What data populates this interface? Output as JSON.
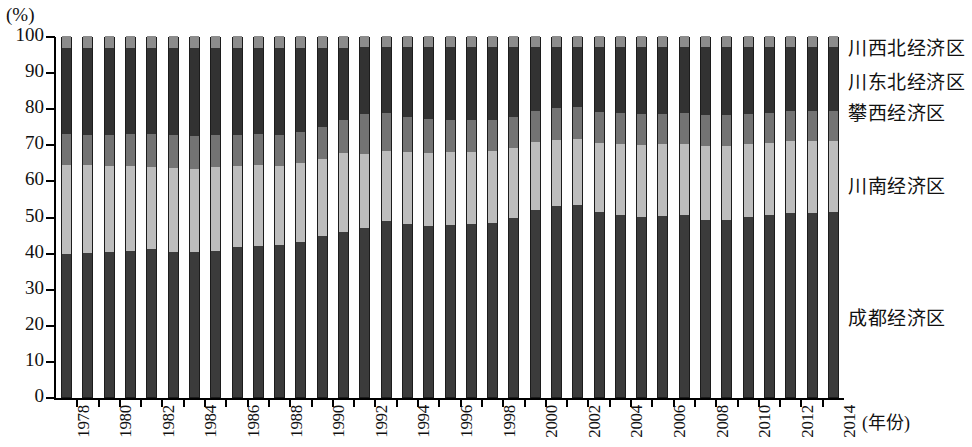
{
  "chart_data": {
    "type": "bar",
    "stacked": true,
    "title": "",
    "subtitle": "",
    "xlabel": "(年份)",
    "ylabel": "(%)",
    "ylim": [
      0,
      100
    ],
    "grid": false,
    "legend_position": "right",
    "y_ticks": [
      0,
      10,
      20,
      30,
      40,
      50,
      60,
      70,
      80,
      90,
      100
    ],
    "y_tick_labels": [
      "0",
      "10",
      "20",
      "30",
      "40",
      "50",
      "60",
      "70",
      "80",
      "90",
      "100"
    ],
    "categories": [
      1978,
      1979,
      1980,
      1981,
      1982,
      1983,
      1984,
      1985,
      1986,
      1987,
      1988,
      1989,
      1990,
      1991,
      1992,
      1993,
      1994,
      1995,
      1996,
      1997,
      1998,
      1999,
      2000,
      2001,
      2002,
      2003,
      2004,
      2005,
      2006,
      2007,
      2008,
      2009,
      2010,
      2011,
      2012,
      2013,
      2014
    ],
    "x_tick_labels": [
      "1978",
      "",
      "1980",
      "",
      "1982",
      "",
      "1984",
      "",
      "1986",
      "",
      "1988",
      "",
      "1990",
      "",
      "1992",
      "",
      "1994",
      "",
      "1996",
      "",
      "1998",
      "",
      "2000",
      "",
      "2002",
      "",
      "2004",
      "",
      "2006",
      "",
      "2008",
      "",
      "2010",
      "",
      "2012",
      "",
      "2014"
    ],
    "series": [
      {
        "name": "成都经济区",
        "color": "#3b3b3b",
        "values": [
          39.6,
          40.0,
          40.1,
          40.5,
          41.0,
          40.3,
          40.1,
          40.5,
          41.5,
          41.8,
          42.0,
          43.0,
          44.5,
          45.6,
          46.8,
          48.7,
          47.9,
          47.3,
          47.6,
          47.9,
          48.2,
          49.5,
          51.9,
          52.9,
          53.3,
          51.2,
          50.3,
          50.0,
          50.2,
          50.3,
          49.0,
          49.0,
          49.8,
          50.5,
          50.9,
          51.0,
          51.2
        ]
      },
      {
        "name": "川南经济区",
        "color": "#bdbdbd",
        "values": [
          24.8,
          24.2,
          23.9,
          23.4,
          22.6,
          23.2,
          23.2,
          23.2,
          22.5,
          22.4,
          22.1,
          21.8,
          21.5,
          22.0,
          20.6,
          19.4,
          20.0,
          20.3,
          20.2,
          20.0,
          19.9,
          19.5,
          18.7,
          18.4,
          18.2,
          19.1,
          19.7,
          19.8,
          19.9,
          19.9,
          20.5,
          20.6,
          20.3,
          20.0,
          19.9,
          19.9,
          19.8
        ]
      },
      {
        "name": "攀西经济区",
        "color": "#737373",
        "values": [
          8.5,
          8.4,
          8.6,
          8.9,
          9.2,
          9.1,
          9.0,
          8.9,
          8.7,
          8.6,
          8.5,
          8.6,
          8.7,
          9.0,
          11.0,
          10.5,
          9.7,
          9.3,
          9.0,
          8.8,
          8.7,
          8.6,
          8.6,
          8.7,
          8.9,
          8.7,
          8.6,
          8.5,
          8.4,
          8.4,
          8.5,
          8.5,
          8.4,
          8.3,
          8.3,
          8.2,
          8.2
        ]
      },
      {
        "name": "川东北经济区",
        "color": "#323232",
        "values": [
          23.8,
          24.1,
          24.1,
          24.0,
          24.0,
          24.2,
          24.5,
          24.2,
          24.1,
          24.0,
          24.2,
          23.4,
          22.1,
          20.2,
          18.5,
          18.3,
          19.3,
          20.0,
          20.1,
          20.2,
          20.1,
          19.3,
          17.7,
          17.0,
          16.6,
          17.9,
          18.4,
          18.6,
          18.4,
          18.3,
          19.0,
          18.9,
          18.5,
          18.2,
          17.9,
          17.9,
          17.8
        ]
      },
      {
        "name": "川西北经济区",
        "color": "#8c8c8c",
        "values": [
          3.3,
          3.3,
          3.3,
          3.2,
          3.2,
          3.2,
          3.2,
          3.2,
          3.2,
          3.2,
          3.2,
          3.2,
          3.2,
          3.2,
          3.1,
          3.1,
          3.1,
          3.1,
          3.1,
          3.1,
          3.1,
          3.1,
          3.1,
          3.0,
          3.0,
          3.1,
          3.0,
          3.1,
          3.1,
          3.1,
          3.0,
          3.0,
          3.0,
          3.0,
          3.0,
          3.0,
          3.0
        ]
      }
    ],
    "legend": [
      {
        "label": "川西北经济区",
        "color": "#8c8c8c"
      },
      {
        "label": "川东北经济区",
        "color": "#323232"
      },
      {
        "label": "攀西经济区",
        "color": "#737373"
      },
      {
        "label": "川南经济区",
        "color": "#bdbdbd"
      },
      {
        "label": "成都经济区",
        "color": "#3b3b3b"
      }
    ]
  }
}
